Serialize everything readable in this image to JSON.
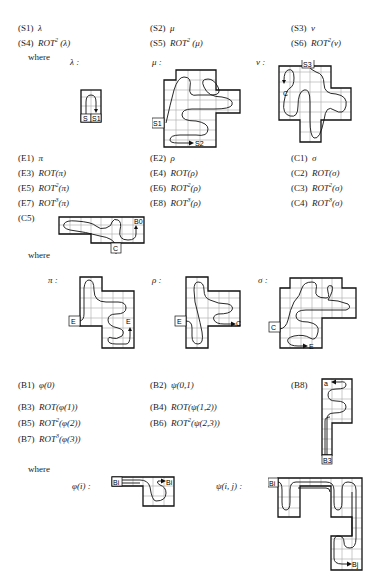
{
  "section_s": {
    "items": [
      {
        "label": "(S1)",
        "expr": "λ"
      },
      {
        "label": "(S2)",
        "expr": "μ"
      },
      {
        "label": "(S3)",
        "expr": "ν"
      },
      {
        "label": "(S4)",
        "rot": "ROT",
        "pow": "2",
        "arg": " (λ)"
      },
      {
        "label": "(S5)",
        "rot": "ROT",
        "pow": "2",
        "arg": " (μ)"
      },
      {
        "label": "(S6)",
        "rot": "ROT",
        "pow": "2",
        "arg": "(ν)"
      }
    ],
    "where": "where",
    "figures": [
      {
        "name": "λ :",
        "labels": [
          "S",
          "S1"
        ]
      },
      {
        "name": "μ :",
        "labels": [
          "S1",
          "S2"
        ]
      },
      {
        "name": "ν :",
        "labels": [
          "S3",
          "C"
        ]
      }
    ]
  },
  "section_ec": {
    "items": [
      {
        "label": "(E1)",
        "expr": "π"
      },
      {
        "label": "(E2)",
        "expr": "ρ"
      },
      {
        "label": "(C1)",
        "expr": "σ"
      },
      {
        "label": "(E3)",
        "rot": "ROT",
        "pow": "",
        "arg": "(π)"
      },
      {
        "label": "(E4)",
        "rot": "ROT",
        "pow": "",
        "arg": "(ρ)"
      },
      {
        "label": "(C2)",
        "rot": "ROT",
        "pow": "",
        "arg": "(σ)"
      },
      {
        "label": "(E5)",
        "rot": "ROT",
        "pow": "2",
        "arg": "(π)"
      },
      {
        "label": "(E6)",
        "rot": "ROT",
        "pow": "2",
        "arg": "(ρ)"
      },
      {
        "label": "(C3)",
        "rot": "ROT",
        "pow": "2",
        "arg": "(σ)"
      },
      {
        "label": "(E7)",
        "rot": "ROT",
        "pow": "3",
        "arg": "(π)"
      },
      {
        "label": "(E8)",
        "rot": "ROT",
        "pow": "3",
        "arg": "(ρ)"
      },
      {
        "label": "(C4)",
        "rot": "ROT",
        "pow": "3",
        "arg": "(σ)"
      }
    ],
    "c5_label": "(C5)",
    "c5_figure_labels": [
      "B0",
      "C"
    ],
    "where": "where",
    "figures": [
      {
        "name": "π :",
        "labels": [
          "E",
          "E"
        ]
      },
      {
        "name": "ρ :",
        "labels": [
          "E",
          "C"
        ]
      },
      {
        "name": "σ :",
        "labels": [
          "C",
          "E"
        ]
      }
    ]
  },
  "section_b": {
    "items": [
      {
        "label": "(B1)",
        "expr": "φ(0)"
      },
      {
        "label": "(B2)",
        "expr": "ψ(0,1)"
      },
      {
        "label": "(B3)",
        "rot": "ROT",
        "pow": "",
        "arg": "(φ(1))"
      },
      {
        "label": "(B4)",
        "rot": "ROT",
        "pow": "",
        "arg": "(ψ(1,2))"
      },
      {
        "label": "(B5)",
        "rot": "ROT",
        "pow": "2",
        "arg": "(φ(2))"
      },
      {
        "label": "(B6)",
        "rot": "ROT",
        "pow": "2",
        "arg": "(ψ(2,3))"
      },
      {
        "label": "(B7)",
        "rot": "ROT",
        "pow": "3",
        "arg": "(φ(3))"
      }
    ],
    "b8_label": "(B8)",
    "b8_figure_labels": [
      "a",
      "B3"
    ],
    "where": "where",
    "figures": [
      {
        "name": "φ(i) :",
        "labels": [
          "Bi",
          "Bi"
        ]
      },
      {
        "name": "ψ(i, j) :",
        "labels": [
          "Bi",
          "Bj"
        ]
      }
    ]
  }
}
